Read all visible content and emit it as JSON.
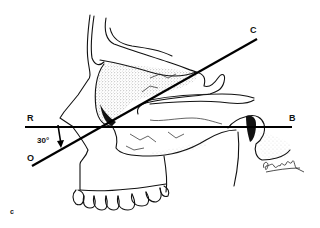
{
  "figure": {
    "labels": {
      "R": "R",
      "B": "B",
      "C": "C",
      "O": "O",
      "angle": "30°"
    },
    "panel_label": "c",
    "signature": "Gershfeld",
    "lines": [
      {
        "name": "R-B",
        "from": [
          25,
          127
        ],
        "to": [
          292,
          127
        ]
      },
      {
        "name": "O-C",
        "from": [
          32,
          166
        ],
        "to": [
          257,
          39
        ]
      }
    ],
    "angle_degrees": 30
  }
}
